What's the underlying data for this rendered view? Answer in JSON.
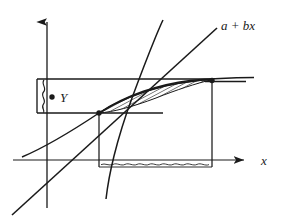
{
  "figure": {
    "kind": "mathematical-diagram",
    "background_color": "#ffffff",
    "ink_color": "#1a1a1a",
    "width": 281,
    "height": 223
  },
  "axes": {
    "x_axis": {
      "label": "x",
      "label_x": 262,
      "label_y": 164,
      "y_position": 160,
      "x_start": 13,
      "x_end": 247,
      "arrow": "right-arrow-head"
    },
    "y_axis": {
      "label": "",
      "x_position": 47,
      "y_start": 208,
      "y_end": 10,
      "arrow": "up-arrow-head"
    }
  },
  "labels": {
    "regression_line": "a + bx",
    "regression_label_x": 222,
    "regression_label_y": 26,
    "response_point": "Y",
    "response_label_x": 63,
    "response_label_y": 101
  },
  "markers": {
    "response_dot": {
      "cx": 52,
      "cy": 97,
      "r": 2.6
    },
    "lower_intersection_dot": {
      "cx": 99,
      "cy": 113,
      "r": 2.6
    },
    "upper_intersection_dot": {
      "cx": 212,
      "cy": 81,
      "r": 2.6
    }
  },
  "band": {
    "description": "horizontal rectangular band around Y",
    "left": 37,
    "right": 212,
    "top": 79,
    "bottom": 113,
    "wavy_left_edge": true
  },
  "segments": {
    "upper_band_extension": {
      "x1": 212,
      "y1": 81,
      "x2": 246,
      "y2": 81
    },
    "lower_band_extension": {
      "x1": 99,
      "y1": 113,
      "x2": 163,
      "y2": 113
    },
    "vertical_drop_left": {
      "x": 99,
      "y_top": 113,
      "y_bottom": 167
    },
    "vertical_drop_right": {
      "x": 212,
      "y_top": 81,
      "y_bottom": 167
    },
    "wavy_interval_baseline": {
      "x1": 99,
      "x2": 212,
      "y": 167
    }
  },
  "curves": {
    "regression_line": {
      "name": "a + bx",
      "type": "straight-line",
      "x1": 12,
      "y1": 216,
      "x2": 218,
      "y2": 28
    },
    "lower_concave_curve": {
      "name": "lower boundary curve",
      "type": "concave-increasing",
      "points": "22,158 60,139 103,115 150,95 195,83 240,78"
    },
    "steep_rising_curve": {
      "name": "steep boundary curve",
      "type": "steep-increasing",
      "points": "104,200 110,176 117,152 126,120 136,88 150,48 162,18"
    },
    "upper_concave_curve": {
      "name": "upper boundary curve",
      "type": "concave-increasing-upper",
      "points": "99,113 125,96 152,87 182,82 212,80 254,79"
    }
  },
  "hatched_region": {
    "description": "lens-shaped region between lower and upper boundary curves",
    "fill": "diagonal-hatch",
    "hatch_angle_deg": 62,
    "hatch_spacing_px": 3.4,
    "stroke_color": "#1a1a1a"
  }
}
